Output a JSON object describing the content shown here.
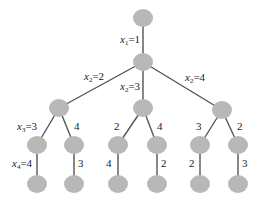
{
  "diagram": {
    "type": "tree",
    "node_color": "#b8b8b8",
    "edge_color": "#555555",
    "nodes": [
      {
        "id": "root",
        "x": 143,
        "y": 18
      },
      {
        "id": "n1",
        "x": 143,
        "y": 62
      },
      {
        "id": "n2a",
        "x": 59,
        "y": 108
      },
      {
        "id": "n2b",
        "x": 143,
        "y": 108
      },
      {
        "id": "n2c",
        "x": 222,
        "y": 110
      },
      {
        "id": "n3a",
        "x": 37,
        "y": 145
      },
      {
        "id": "n3b",
        "x": 74,
        "y": 145
      },
      {
        "id": "n3c",
        "x": 118,
        "y": 145
      },
      {
        "id": "n3d",
        "x": 157,
        "y": 145
      },
      {
        "id": "n3e",
        "x": 200,
        "y": 145
      },
      {
        "id": "n3f",
        "x": 238,
        "y": 145
      },
      {
        "id": "n4a",
        "x": 37,
        "y": 184
      },
      {
        "id": "n4b",
        "x": 74,
        "y": 184
      },
      {
        "id": "n4c",
        "x": 118,
        "y": 184
      },
      {
        "id": "n4d",
        "x": 157,
        "y": 184
      },
      {
        "id": "n4e",
        "x": 200,
        "y": 184
      },
      {
        "id": "n4f",
        "x": 238,
        "y": 184
      }
    ],
    "labels": {
      "x1_var": "x",
      "x1_sub": "1",
      "x1_val": "=1",
      "x2a_var": "x",
      "x2a_sub": "2",
      "x2a_val": "=2",
      "x2b_var": "x",
      "x2b_sub": "2",
      "x2b_val": "=3",
      "x2c_var": "x",
      "x2c_sub": "2",
      "x2c_val": "=4",
      "x3a_var": "x",
      "x3a_sub": "3",
      "x3a_val": "=3",
      "x3b": "4",
      "x3c": "2",
      "x3d": "4",
      "x3e": "3",
      "x3f": "2",
      "x4a_var": "x",
      "x4a_sub": "4",
      "x4a_val": "=4",
      "x4b": "3",
      "x4c": "4",
      "x4d": "2",
      "x4e": "2",
      "x4f": "3"
    }
  }
}
